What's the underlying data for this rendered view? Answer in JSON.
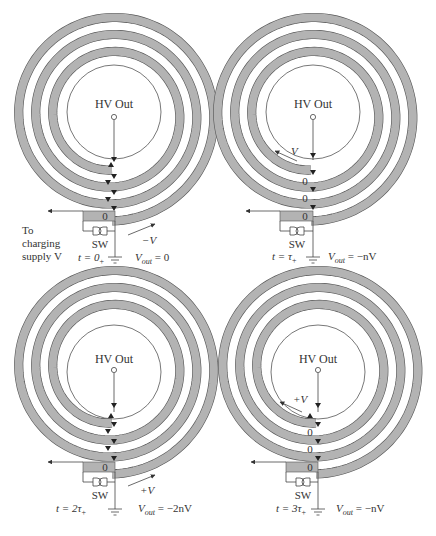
{
  "colors": {
    "strip_fill": "#b3b3b3",
    "strip_edge": "#555555",
    "line": "#444444",
    "text": "#333333"
  },
  "panels": [
    {
      "id": "p1",
      "origin": [
        0,
        0
      ],
      "hv_label": "HV Out",
      "time_label": "t = 0+",
      "time_main": "t = 0",
      "time_sub": "+",
      "vout_label": "Vout = 0",
      "vout_main": "V",
      "vout_sub": "out",
      "vout_rhs": " = 0",
      "wave_label": "−V",
      "wave_position": "outside",
      "junction_labels": [
        "0"
      ],
      "switch_label": "SW",
      "supply_label_lines": [
        "To",
        "charging",
        "supply V"
      ]
    },
    {
      "id": "p2",
      "origin": [
        218,
        0
      ],
      "hv_label": "HV Out",
      "time_label": "t = τ+",
      "time_main": "t = τ",
      "time_sub": "+",
      "vout_label": "Vout = −nV",
      "vout_main": "V",
      "vout_sub": "out",
      "vout_rhs": " = −nV",
      "wave_label": "V",
      "wave_position": "inside",
      "junction_labels": [
        "0",
        "0",
        "0"
      ],
      "switch_label": "SW"
    },
    {
      "id": "p3",
      "origin": [
        0,
        272
      ],
      "hv_label": "HV Out",
      "time_label": "t = 2τ+",
      "time_main": "t = 2τ",
      "time_sub": "+",
      "vout_label": "Vout = −2nV",
      "vout_main": "V",
      "vout_sub": "out",
      "vout_rhs": " = −2nV",
      "wave_label": "+V",
      "wave_position": "outside",
      "junction_labels": [
        "0"
      ],
      "switch_label": "SW"
    },
    {
      "id": "p4",
      "origin": [
        218,
        272
      ],
      "hv_label": "HV Out",
      "time_label": "t = 3τ+",
      "time_main": "t = 3τ",
      "time_sub": "+",
      "vout_label": "Vout = −nV",
      "vout_main": "V",
      "vout_sub": "out",
      "vout_rhs": " = −nV",
      "wave_label": "+V",
      "wave_position": "inside",
      "junction_labels": [
        "0",
        "0",
        "0"
      ],
      "switch_label": "SW"
    }
  ]
}
